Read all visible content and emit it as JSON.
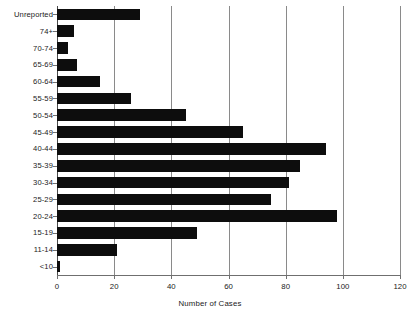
{
  "chart_data": {
    "type": "bar",
    "orientation": "horizontal",
    "title": "",
    "subtitle": "",
    "xlabel": "Number of Cases",
    "ylabel": "",
    "xlim": [
      0,
      120
    ],
    "xticks": [
      0,
      20,
      40,
      60,
      80,
      100,
      120
    ],
    "xtick_labels": [
      "0",
      "20",
      "40",
      "60",
      "80",
      "100",
      "120"
    ],
    "grid": true,
    "grid_axis": "x",
    "legend": false,
    "legend_position": "none",
    "bar_color": "#0d0d0d",
    "gridline_color": "#8a8a8a",
    "axis_color": "#6f6f6f",
    "background_color": "#ffffff",
    "categories": [
      "Unreported",
      "74+",
      "70-74",
      "65-69",
      "60-64",
      "55-59",
      "50-54",
      "45-49",
      "40-44",
      "35-39",
      "30-34",
      "25-29",
      "20-24",
      "15-19",
      "11-14",
      "<10"
    ],
    "values": [
      29,
      6,
      4,
      7,
      15,
      26,
      45,
      65,
      94,
      85,
      81,
      75,
      98,
      49,
      21,
      1
    ]
  }
}
